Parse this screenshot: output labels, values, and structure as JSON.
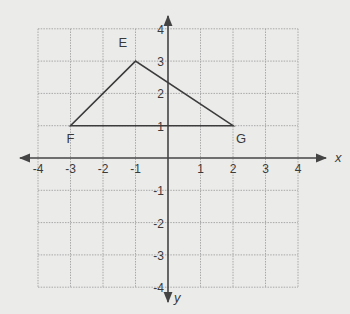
{
  "diagram": {
    "type": "coordinate-plane-triangle",
    "axes": {
      "x_label": "x",
      "y_label": "y",
      "x_range": [
        -4,
        4
      ],
      "y_range": [
        -4,
        4
      ],
      "x_ticks": [
        "-4",
        "-3",
        "-2",
        "-1",
        "1",
        "2",
        "3",
        "4"
      ],
      "y_ticks": [
        "4",
        "3",
        "2",
        "1",
        "-1",
        "-2",
        "-3",
        "-4"
      ],
      "grid": true
    },
    "vertices": [
      {
        "label": "E",
        "x": -1,
        "y": 3
      },
      {
        "label": "F",
        "x": -3,
        "y": 1
      },
      {
        "label": "G",
        "x": 2,
        "y": 1
      }
    ],
    "colors": {
      "background": "#ebebea",
      "grid": "#a8a8a8",
      "axis": "#444444",
      "shape": "#3c3c3c",
      "text": "#3a3a3a"
    }
  },
  "chart_data": {
    "type": "scatter",
    "title": "",
    "xlabel": "x",
    "ylabel": "y",
    "xlim": [
      -4,
      4
    ],
    "ylim": [
      -4,
      4
    ],
    "grid": true,
    "points": [
      {
        "label": "E",
        "x": -1,
        "y": 3
      },
      {
        "label": "F",
        "x": -3,
        "y": 1
      },
      {
        "label": "G",
        "x": 2,
        "y": 1
      }
    ],
    "polygon": [
      "E",
      "F",
      "G"
    ]
  }
}
